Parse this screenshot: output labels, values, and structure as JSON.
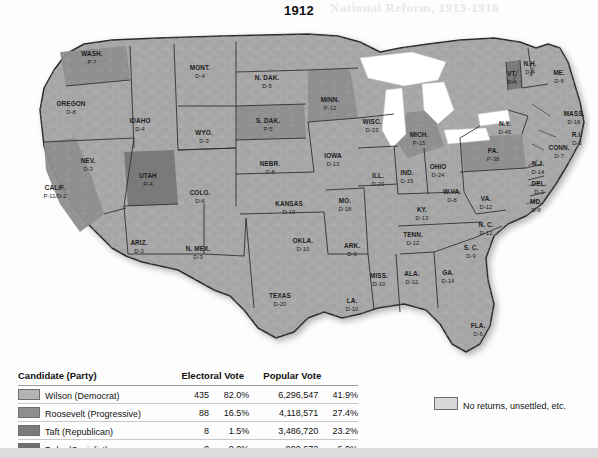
{
  "title": "1912",
  "bleed_text": "National Reform, 1913-1916",
  "colors": {
    "wilson_democrat": "#b4b4b4",
    "roosevelt_progressive": "#8e8e8e",
    "taft_republican": "#7a7a7a",
    "debs_socialist": "#6f6f6f",
    "no_returns": "#d8d8d8",
    "map_base": "#a8a8a8",
    "map_border": "#2b2b2b",
    "page_background": "#fdfdfd"
  },
  "legend": {
    "headers": {
      "candidate": "Candidate (Party)",
      "electoral": "Electoral Vote",
      "popular": "Popular Vote"
    },
    "rows": [
      {
        "candidate": "Wilson (Democrat)",
        "swatch": "#b4b4b4",
        "electoral_votes": "435",
        "electoral_pct": "82.0%",
        "popular_votes": "6,296,547",
        "popular_pct": "41.9%"
      },
      {
        "candidate": "Roosevelt (Progressive)",
        "swatch": "#8e8e8e",
        "electoral_votes": "88",
        "electoral_pct": "16.5%",
        "popular_votes": "4,118,571",
        "popular_pct": "27.4%"
      },
      {
        "candidate": "Taft (Republican)",
        "swatch": "#7a7a7a",
        "electoral_votes": "8",
        "electoral_pct": "1.5%",
        "popular_votes": "3,486,720",
        "popular_pct": "23.2%"
      },
      {
        "candidate": "Debs (Socialist)",
        "swatch": "#6f6f6f",
        "electoral_votes": "0",
        "electoral_pct": "0.0%",
        "popular_votes": "900,672",
        "popular_pct": "6.0%"
      }
    ],
    "no_returns_label": "No returns, unsettled, etc."
  },
  "states": [
    {
      "name": "WASH.",
      "result": "P-7",
      "x": 84,
      "y": 38,
      "winner": "progressive"
    },
    {
      "name": "OREGON",
      "result": "D-8",
      "x": 63,
      "y": 88,
      "winner": "democrat"
    },
    {
      "name": "IDAHO",
      "result": "D-4",
      "x": 132,
      "y": 105,
      "winner": "democrat"
    },
    {
      "name": "MONT.",
      "result": "D-4",
      "x": 192,
      "y": 52,
      "winner": "democrat"
    },
    {
      "name": "WYO.",
      "result": "D-3",
      "x": 196,
      "y": 117,
      "winner": "democrat"
    },
    {
      "name": "NEV.",
      "result": "D-3",
      "x": 80,
      "y": 145,
      "winner": "democrat"
    },
    {
      "name": "UTAH",
      "result": "R-4",
      "x": 140,
      "y": 160,
      "winner": "republican"
    },
    {
      "name": "CALIF.",
      "result": "P-11/D-2",
      "x": 47,
      "y": 172,
      "winner": "progressive"
    },
    {
      "name": "COLO.",
      "result": "D-6",
      "x": 192,
      "y": 177,
      "winner": "democrat"
    },
    {
      "name": "ARIZ.",
      "result": "D-3",
      "x": 131,
      "y": 227,
      "winner": "democrat"
    },
    {
      "name": "N. MEX.",
      "result": "D-3",
      "x": 190,
      "y": 233,
      "winner": "democrat"
    },
    {
      "name": "N. DAK.",
      "result": "D-5",
      "x": 259,
      "y": 62,
      "winner": "democrat"
    },
    {
      "name": "S. DAK.",
      "result": "P-5",
      "x": 260,
      "y": 105,
      "winner": "progressive"
    },
    {
      "name": "NEBR.",
      "result": "D-8",
      "x": 262,
      "y": 148,
      "winner": "democrat"
    },
    {
      "name": "KANSAS",
      "result": "D-10",
      "x": 281,
      "y": 188,
      "winner": "democrat"
    },
    {
      "name": "OKLA.",
      "result": "D-10",
      "x": 295,
      "y": 225,
      "winner": "democrat"
    },
    {
      "name": "TEXAS",
      "result": "D-20",
      "x": 272,
      "y": 280,
      "winner": "democrat"
    },
    {
      "name": "MINN.",
      "result": "P-12",
      "x": 322,
      "y": 84,
      "winner": "progressive"
    },
    {
      "name": "IOWA",
      "result": "D-13",
      "x": 325,
      "y": 140,
      "winner": "democrat"
    },
    {
      "name": "MO.",
      "result": "D-18",
      "x": 337,
      "y": 185,
      "winner": "democrat"
    },
    {
      "name": "ARK.",
      "result": "D-9",
      "x": 344,
      "y": 230,
      "winner": "democrat"
    },
    {
      "name": "LA.",
      "result": "D-10",
      "x": 344,
      "y": 285,
      "winner": "democrat"
    },
    {
      "name": "MISS.",
      "result": "D-10",
      "x": 371,
      "y": 260,
      "winner": "democrat"
    },
    {
      "name": "WISC.",
      "result": "D-13",
      "x": 364,
      "y": 106,
      "winner": "democrat"
    },
    {
      "name": "ILL.",
      "result": "D-29",
      "x": 370,
      "y": 160,
      "winner": "democrat"
    },
    {
      "name": "IND.",
      "result": "D-15",
      "x": 399,
      "y": 157,
      "winner": "democrat"
    },
    {
      "name": "MICH.",
      "result": "P-15",
      "x": 411,
      "y": 119,
      "winner": "progressive"
    },
    {
      "name": "OHIO",
      "result": "D-24",
      "x": 430,
      "y": 151,
      "winner": "democrat"
    },
    {
      "name": "KY.",
      "result": "D-13",
      "x": 414,
      "y": 194,
      "winner": "democrat"
    },
    {
      "name": "TENN.",
      "result": "D-12",
      "x": 405,
      "y": 219,
      "winner": "democrat"
    },
    {
      "name": "ALA.",
      "result": "D-12",
      "x": 404,
      "y": 258,
      "winner": "democrat"
    },
    {
      "name": "GA.",
      "result": "D-14",
      "x": 440,
      "y": 257,
      "winner": "democrat"
    },
    {
      "name": "FLA.",
      "result": "D-6",
      "x": 470,
      "y": 310,
      "winner": "democrat"
    },
    {
      "name": "S. C.",
      "result": "D-9",
      "x": 463,
      "y": 232,
      "winner": "democrat"
    },
    {
      "name": "N. C.",
      "result": "D-12",
      "x": 478,
      "y": 209,
      "winner": "democrat"
    },
    {
      "name": "W.VA.",
      "result": "D-8",
      "x": 444,
      "y": 176,
      "winner": "democrat"
    },
    {
      "name": "VA.",
      "result": "D-12",
      "x": 478,
      "y": 183,
      "winner": "democrat"
    },
    {
      "name": "PA.",
      "result": "P-38",
      "x": 485,
      "y": 135,
      "winner": "progressive"
    },
    {
      "name": "N.Y.",
      "result": "D-45",
      "x": 497,
      "y": 108,
      "winner": "democrat"
    },
    {
      "name": "VT.",
      "result": "R-4",
      "x": 504,
      "y": 58,
      "winner": "republican"
    },
    {
      "name": "N.H.",
      "result": "D-4",
      "x": 522,
      "y": 48,
      "winner": "democrat"
    },
    {
      "name": "ME.",
      "result": "D-6",
      "x": 551,
      "y": 57,
      "winner": "democrat"
    },
    {
      "name": "MASS.",
      "result": "D-18",
      "x": 566,
      "y": 98,
      "winner": "democrat"
    },
    {
      "name": "R.I.",
      "result": "D-5",
      "x": 569,
      "y": 119,
      "winner": "democrat"
    },
    {
      "name": "CONN.",
      "result": "D-7",
      "x": 551,
      "y": 132,
      "winner": "democrat"
    },
    {
      "name": "N.J.",
      "result": "D-14",
      "x": 530,
      "y": 148,
      "winner": "democrat"
    },
    {
      "name": "DEL.",
      "result": "D-3",
      "x": 531,
      "y": 168,
      "winner": "democrat"
    },
    {
      "name": "MD.",
      "result": "D-8",
      "x": 528,
      "y": 186,
      "winner": "democrat"
    }
  ]
}
